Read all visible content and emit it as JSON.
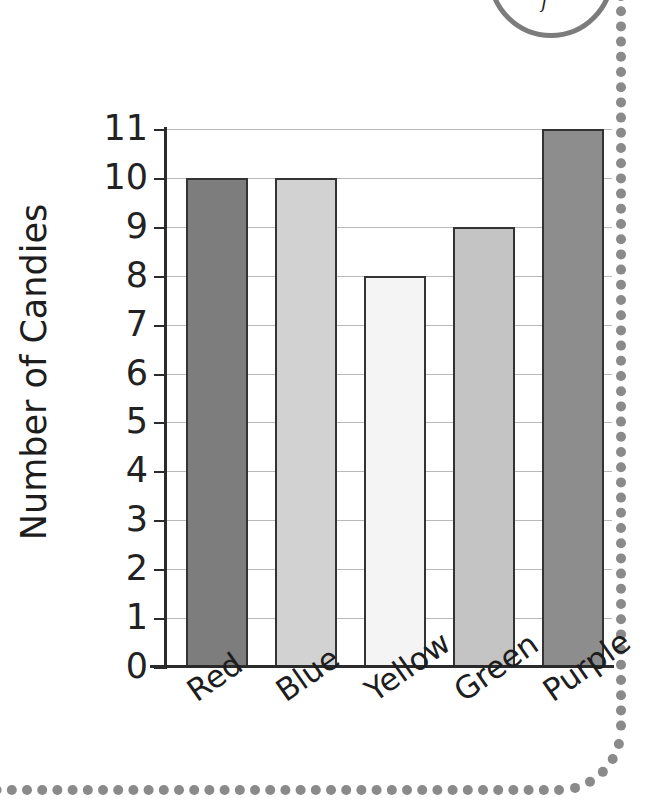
{
  "chart_data": {
    "type": "bar",
    "title": "",
    "xlabel": "",
    "ylabel": "Number of Candies",
    "categories": [
      "Red",
      "Blue",
      "Yellow",
      "Green",
      "Purple"
    ],
    "values": [
      10,
      10,
      8,
      9,
      11
    ],
    "ylim": [
      0,
      11
    ],
    "ytick_labels": [
      "11",
      "10",
      "9",
      "8",
      "7",
      "6",
      "5",
      "4",
      "3",
      "2",
      "1",
      "0"
    ],
    "ytick_values": [
      11,
      10,
      9,
      8,
      7,
      6,
      5,
      4,
      3,
      2,
      1,
      0
    ],
    "grid": true,
    "legend": "none",
    "xtick_rotation_deg": -35,
    "bar_fills": [
      "#7d7d7d",
      "#d2d2d2",
      "#f4f4f4",
      "#c4c4c4",
      "#8d8d8d"
    ],
    "bar_edge_color": "#333333",
    "gridline_color": "#b9b9b9",
    "axis_color": "#2b2b2b",
    "text_color": "#1d1d1d",
    "background": "#ffffff"
  },
  "decoration": {
    "dot_color": "#8a8a8a",
    "badge_stroke": "#7c7c7c",
    "badge_mark": "f"
  }
}
